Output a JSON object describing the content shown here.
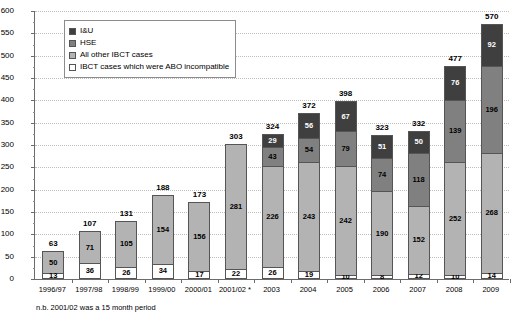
{
  "chart_data": {
    "type": "bar",
    "title": "",
    "subtitle": "",
    "xlabel": "",
    "ylabel": "",
    "ylim": [
      0,
      600
    ],
    "ytick_step": 50,
    "yticks": [
      0,
      50,
      100,
      150,
      200,
      250,
      300,
      350,
      400,
      450,
      500,
      550,
      600
    ],
    "grid": true,
    "stacked": true,
    "legend_position": "top-left-inside",
    "categories": [
      "1996/97",
      "1997/98",
      "1998/99",
      "1999/00",
      "2000/01",
      "2001/02 *",
      "2003",
      "2004",
      "2005",
      "2006",
      "2007",
      "2008",
      "2009"
    ],
    "series": [
      {
        "name": "IBCT cases which were ABO incompatible",
        "color": "#ffffff",
        "values": [
          13,
          36,
          26,
          34,
          17,
          22,
          26,
          19,
          10,
          8,
          12,
          10,
          14
        ]
      },
      {
        "name": "All other IBCT cases",
        "color": "#b3b3b3",
        "values": [
          50,
          71,
          105,
          154,
          156,
          281,
          226,
          243,
          242,
          190,
          152,
          252,
          268
        ]
      },
      {
        "name": "HSE",
        "color": "#808080",
        "values": [
          null,
          null,
          null,
          null,
          null,
          null,
          43,
          54,
          79,
          74,
          118,
          139,
          196
        ]
      },
      {
        "name": "I&U",
        "color": "#3f3f3f",
        "values": [
          null,
          null,
          null,
          null,
          null,
          null,
          29,
          56,
          67,
          51,
          50,
          76,
          92
        ]
      }
    ],
    "totals": [
      63,
      107,
      131,
      188,
      173,
      303,
      324,
      372,
      398,
      323,
      332,
      477,
      570
    ],
    "annotations": [
      "n.b. 2001/02 was a 15 month period"
    ]
  },
  "legend": {
    "items": [
      {
        "label": "I&U",
        "swatch_name": "legend-swatch-iu",
        "color": "#3f3f3f"
      },
      {
        "label": "HSE",
        "swatch_name": "legend-swatch-hse",
        "color": "#808080"
      },
      {
        "label": "All other IBCT cases",
        "swatch_name": "legend-swatch-other-ibct",
        "color": "#b3b3b3"
      },
      {
        "label": "IBCT cases which were ABO incompatible",
        "swatch_name": "legend-swatch-abo",
        "color": "#ffffff"
      }
    ]
  },
  "footnote": {
    "text": "n.b. 2001/02 was a 15 month period"
  },
  "colors": {
    "axis": "#6b6b6b",
    "grid": "#bdbdbd",
    "bar_border": "#555555",
    "background": "#ffffff"
  }
}
